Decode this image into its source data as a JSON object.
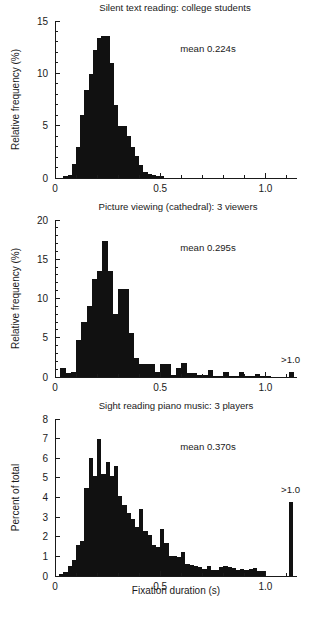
{
  "figure": {
    "xlabel": "Fixation duration (s)",
    "bar_color": "#111111",
    "axis_color": "#1a1a1a"
  },
  "chart_data": [
    {
      "type": "bar",
      "panel_index": 1,
      "title": "Silent text reading: college students",
      "annotation": "mean 0.224s",
      "mean_seconds": 0.224,
      "xlabel": "",
      "ylabel": "Relative frequency (%)",
      "xlim": [
        0,
        1.15
      ],
      "ylim": [
        0,
        15
      ],
      "xticks": [
        0,
        0.5,
        1.0
      ],
      "xtick_labels": [
        "0",
        "0.5",
        "1.0"
      ],
      "xminor_step": 0.1,
      "yticks": [
        0,
        5,
        10,
        15
      ],
      "ytick_labels": [
        "0",
        "5",
        "10",
        "15"
      ],
      "yminor_step": 1,
      "grid": false,
      "legend": "none",
      "bin_width": 0.02,
      "bin_starts": [
        0.04,
        0.06,
        0.08,
        0.1,
        0.12,
        0.14,
        0.16,
        0.18,
        0.2,
        0.22,
        0.24,
        0.26,
        0.28,
        0.3,
        0.32,
        0.34,
        0.36,
        0.38,
        0.4,
        0.42,
        0.44,
        0.46,
        0.48,
        0.5
      ],
      "values": [
        0.2,
        0.3,
        1.3,
        3.0,
        6.0,
        8.4,
        9.9,
        12.2,
        13.4,
        13.6,
        13.6,
        11.0,
        7.0,
        5.0,
        5.0,
        4.0,
        3.0,
        2.1,
        1.2,
        0.6,
        0.4,
        0.3,
        0.2,
        0.15
      ],
      "has_overflow_bar": false
    },
    {
      "type": "bar",
      "panel_index": 2,
      "title": "Picture viewing (cathedral): 3 viewers",
      "annotation": "mean 0.295s",
      "mean_seconds": 0.295,
      "xlabel": "",
      "ylabel": "Relative frequency (%)",
      "xlim": [
        0,
        1.15
      ],
      "ylim": [
        0,
        20
      ],
      "xticks": [
        0,
        0.5,
        1.0
      ],
      "xtick_labels": [
        "0",
        "0.5",
        "1.0"
      ],
      "xminor_step": 0.1,
      "yticks": [
        0,
        5,
        10,
        15,
        20
      ],
      "ytick_labels": [
        "0",
        "5",
        "10",
        "15",
        "20"
      ],
      "yminor_step": 1,
      "grid": false,
      "legend": "none",
      "overflow_label": ">1.0",
      "bin_width": 0.025,
      "bin_starts": [
        0.025,
        0.05,
        0.075,
        0.1,
        0.125,
        0.15,
        0.175,
        0.2,
        0.225,
        0.25,
        0.275,
        0.3,
        0.325,
        0.35,
        0.375,
        0.4,
        0.425,
        0.45,
        0.475,
        0.5,
        0.525,
        0.55,
        0.575,
        0.6,
        0.625,
        0.65,
        0.675,
        0.7,
        0.725,
        0.75,
        0.775,
        0.8,
        0.825,
        0.85,
        0.875,
        0.9,
        0.925,
        0.95,
        0.975,
        1.0
      ],
      "values": [
        1.1,
        0.5,
        0.6,
        4.7,
        7.0,
        9.0,
        12.5,
        13.5,
        17.3,
        13.5,
        8.0,
        11.2,
        11.2,
        5.6,
        2.4,
        1.6,
        1.6,
        1.6,
        0.6,
        1.6,
        1.6,
        0.3,
        1.1,
        1.8,
        0.5,
        0.5,
        0.2,
        0.2,
        0.9,
        0.1,
        0.1,
        0.6,
        0.1,
        0.1,
        0.6,
        0.1,
        0.1,
        0.4,
        0.1,
        0.1
      ],
      "has_overflow_bar": true,
      "overflow_x": 1.11,
      "overflow_value": 0.7
    },
    {
      "type": "bar",
      "panel_index": 3,
      "title": "Sight reading piano music: 3 players",
      "annotation": "mean 0.370s",
      "mean_seconds": 0.37,
      "xlabel": "Fixation duration (s)",
      "ylabel": "Percent of total",
      "xlim": [
        0,
        1.15
      ],
      "ylim": [
        0,
        8
      ],
      "xticks": [
        0,
        0.5,
        1.0
      ],
      "xtick_labels": [
        "0",
        "0.5",
        "1.0"
      ],
      "xminor_step": 0.1,
      "yticks": [
        0,
        1,
        2,
        3,
        4,
        5,
        6,
        7,
        8
      ],
      "ytick_labels": [
        "0",
        "1",
        "2",
        "3",
        "4",
        "5",
        "6",
        "7",
        "8"
      ],
      "yminor_step": 1,
      "grid": false,
      "legend": "none",
      "overflow_label": ">1.0",
      "bin_width": 0.02,
      "bin_starts": [
        0.02,
        0.04,
        0.06,
        0.08,
        0.1,
        0.12,
        0.14,
        0.16,
        0.18,
        0.2,
        0.22,
        0.24,
        0.26,
        0.28,
        0.3,
        0.32,
        0.34,
        0.36,
        0.38,
        0.4,
        0.42,
        0.44,
        0.46,
        0.48,
        0.5,
        0.52,
        0.54,
        0.56,
        0.58,
        0.6,
        0.62,
        0.64,
        0.66,
        0.68,
        0.7,
        0.72,
        0.74,
        0.76,
        0.78,
        0.8,
        0.82,
        0.84,
        0.86,
        0.88,
        0.9,
        0.92,
        0.94,
        0.96,
        0.98
      ],
      "values": [
        0.1,
        0.2,
        0.5,
        0.8,
        1.6,
        1.8,
        4.5,
        6.0,
        5.1,
        7.0,
        5.2,
        5.8,
        5.1,
        5.6,
        4.1,
        3.6,
        3.2,
        2.9,
        2.5,
        3.4,
        2.3,
        2.1,
        1.6,
        1.5,
        2.4,
        1.7,
        1.0,
        1.0,
        0.95,
        1.2,
        0.6,
        0.55,
        0.5,
        0.45,
        0.35,
        0.5,
        0.3,
        0.3,
        0.45,
        0.5,
        0.45,
        0.4,
        0.3,
        0.35,
        0.3,
        0.35,
        0.4,
        0.25,
        0.25
      ],
      "has_overflow_bar": true,
      "overflow_x": 1.11,
      "overflow_value": 3.75
    }
  ]
}
